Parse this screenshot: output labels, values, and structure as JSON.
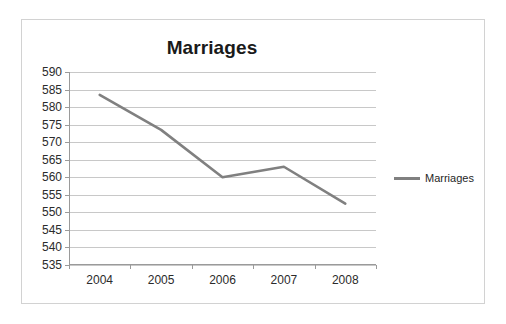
{
  "chart_data": {
    "type": "line",
    "title": "Marriages",
    "xlabel": "",
    "ylabel": "",
    "categories": [
      "2004",
      "2005",
      "2006",
      "2007",
      "2008"
    ],
    "series": [
      {
        "name": "Marriages",
        "color": "#808080",
        "values": [
          583.5,
          573.5,
          560,
          563,
          552.5
        ]
      }
    ],
    "ylim": [
      535,
      590
    ],
    "ytick_step": 5,
    "yticks": [
      590,
      585,
      580,
      575,
      570,
      565,
      560,
      555,
      550,
      545,
      540,
      535
    ],
    "grid": true,
    "legend": "right",
    "legend_entries": [
      "Marriages"
    ],
    "gridline_color": "#c8c8c8",
    "axis_color": "#9a9a9a",
    "background": "#ffffff",
    "border_color": "#d2d2d2"
  }
}
